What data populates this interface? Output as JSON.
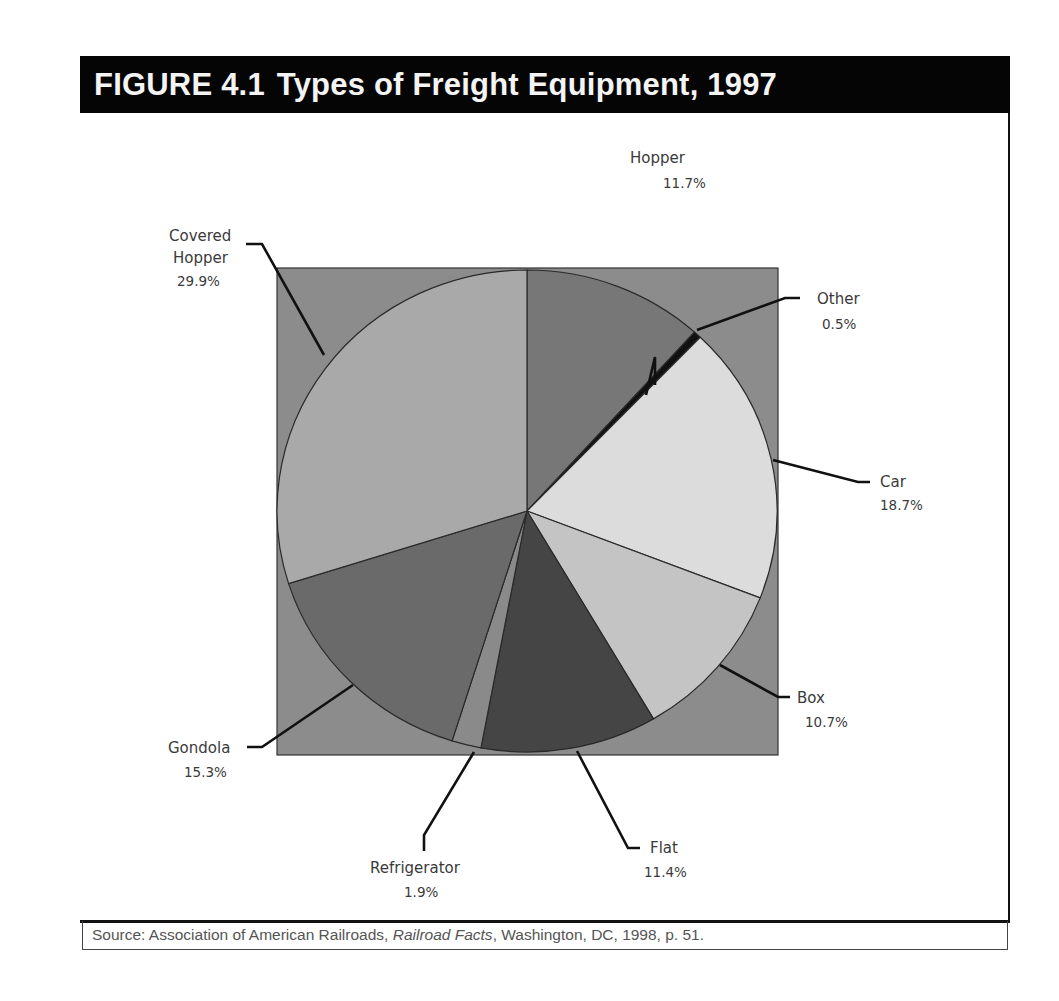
{
  "figure": {
    "number": "FIGURE 4.1",
    "title": "Types of Freight Equipment, 1997"
  },
  "source": {
    "prefix": "Source: Association of American Railroads, ",
    "publication": "Railroad Facts",
    "suffix": ", Washington, DC, 1998, p. 51."
  },
  "colors": {
    "header_bg": "#050505",
    "plot_bg": "#8c8c8c",
    "hopper": "#777777",
    "other": "#111111",
    "car": "#dcdcdc",
    "box": "#c4c4c4",
    "flat": "#454545",
    "refrigerator": "#8a8a8a",
    "gondola": "#6a6a6a",
    "covered_hopper": "#a9a9a9"
  },
  "chart_data": {
    "type": "pie",
    "start_angle": "12 o'clock, clockwise",
    "categories": [
      "Hopper",
      "Other",
      "Car",
      "Box",
      "Flat",
      "Refrigerator",
      "Gondola",
      "Covered Hopper"
    ],
    "values": [
      11.7,
      0.5,
      18.7,
      10.7,
      11.4,
      1.9,
      15.3,
      29.9
    ],
    "unit": "%",
    "labels": [
      {
        "name": "Hopper",
        "pct": "11.7%"
      },
      {
        "name": "Other",
        "pct": "0.5%"
      },
      {
        "name": "Car",
        "pct": "18.7%"
      },
      {
        "name": "Box",
        "pct": "10.7%"
      },
      {
        "name": "Flat",
        "pct": "11.4%"
      },
      {
        "name": "Refrigerator",
        "pct": "1.9%"
      },
      {
        "name": "Gondola",
        "pct": "15.3%"
      },
      {
        "name": "Covered Hopper",
        "name_line1": "Covered",
        "name_line2": "Hopper",
        "pct": "29.9%"
      }
    ],
    "legend": "none (callout labels)",
    "source": "Association of American Railroads, Railroad Facts, Washington, DC, 1998, p. 51."
  }
}
